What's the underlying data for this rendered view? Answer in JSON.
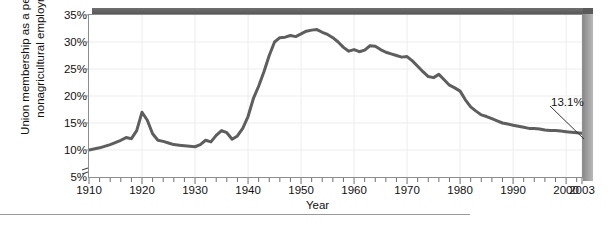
{
  "chart_data": {
    "type": "line",
    "title": "",
    "xlabel": "Year",
    "ylabel": "Union membership as a percent of nonagricultural employment",
    "ylabel_line1": "Union membership as a percent of",
    "ylabel_line2": "nonagricultural employment",
    "xlim": [
      1910,
      2003
    ],
    "ylim": [
      5,
      35
    ],
    "ytick_labels": [
      "35%",
      "30%",
      "25%",
      "20%",
      "15%",
      "10%",
      "5%"
    ],
    "ytick_values": [
      35,
      30,
      25,
      20,
      15,
      10,
      5
    ],
    "xtick_labels": [
      "1910",
      "1920",
      "1930",
      "1940",
      "1950",
      "1960",
      "1970",
      "1980",
      "1990",
      "2000",
      "2003"
    ],
    "xtick_values": [
      1910,
      1920,
      1930,
      1940,
      1950,
      1960,
      1970,
      1980,
      1990,
      2000,
      2003
    ],
    "minor_xtick_interval": 2,
    "grid": true,
    "legend": "none",
    "axis_break": true,
    "line_color": "#5e5e5e",
    "grid_color": "#ededed",
    "axis_color": "#8d8d8d",
    "shadow_color": "#5a5a5a",
    "annotations": [
      {
        "label": "13.1%",
        "x": 2003,
        "y": 13.1
      }
    ],
    "series": [
      {
        "name": "Union membership as a percent of nonagricultural employment",
        "x": [
          1910,
          1912,
          1914,
          1916,
          1917,
          1918,
          1919,
          1920,
          1921,
          1922,
          1923,
          1924,
          1925,
          1926,
          1927,
          1928,
          1929,
          1930,
          1931,
          1932,
          1933,
          1934,
          1935,
          1936,
          1937,
          1938,
          1939,
          1940,
          1941,
          1942,
          1943,
          1944,
          1945,
          1946,
          1947,
          1948,
          1949,
          1950,
          1951,
          1952,
          1953,
          1954,
          1955,
          1956,
          1957,
          1958,
          1959,
          1960,
          1961,
          1962,
          1963,
          1964,
          1965,
          1966,
          1967,
          1968,
          1969,
          1970,
          1971,
          1972,
          1973,
          1974,
          1975,
          1976,
          1977,
          1978,
          1979,
          1980,
          1981,
          1982,
          1983,
          1984,
          1985,
          1986,
          1987,
          1988,
          1989,
          1990,
          1991,
          1992,
          1993,
          1994,
          1995,
          1996,
          1997,
          1998,
          1999,
          2000,
          2001,
          2002,
          2003
        ],
        "y": [
          10.0,
          10.4,
          11.0,
          11.8,
          12.3,
          12.1,
          13.6,
          17.0,
          15.5,
          13.0,
          11.8,
          11.6,
          11.3,
          11.0,
          10.9,
          10.8,
          10.7,
          10.6,
          11.0,
          11.8,
          11.5,
          12.7,
          13.6,
          13.2,
          12.0,
          12.6,
          14.0,
          16.2,
          19.5,
          21.8,
          24.5,
          27.5,
          30.0,
          30.8,
          30.9,
          31.2,
          31.0,
          31.5,
          32.0,
          32.2,
          32.3,
          31.8,
          31.4,
          30.8,
          30.0,
          29.0,
          28.3,
          28.6,
          28.2,
          28.5,
          29.3,
          29.2,
          28.6,
          28.1,
          27.8,
          27.5,
          27.2,
          27.3,
          26.5,
          25.5,
          24.5,
          23.6,
          23.4,
          24.0,
          23.0,
          22.0,
          21.5,
          20.9,
          19.3,
          18.0,
          17.2,
          16.5,
          16.2,
          15.8,
          15.4,
          15.0,
          14.8,
          14.6,
          14.4,
          14.2,
          14.0,
          14.0,
          13.9,
          13.7,
          13.6,
          13.6,
          13.5,
          13.4,
          13.3,
          13.2,
          13.1
        ]
      }
    ]
  }
}
